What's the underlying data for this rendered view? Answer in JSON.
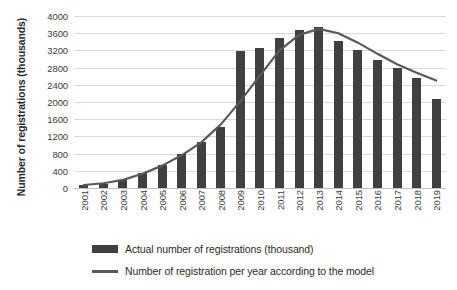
{
  "chart_data": {
    "type": "bar",
    "title": "",
    "subtitle": "",
    "xlabel": "",
    "ylabel": "Number of registrations (thousands)",
    "categories": [
      "2001",
      "2002",
      "2003",
      "2004",
      "2005",
      "2006",
      "2007",
      "2008",
      "2009",
      "2010",
      "2011",
      "2012",
      "2013",
      "2014",
      "2015",
      "2016",
      "2017",
      "2018",
      "2019"
    ],
    "ylim": [
      0,
      4000
    ],
    "y_ticks": [
      0,
      400,
      800,
      1200,
      1600,
      2000,
      2400,
      2800,
      3200,
      3600,
      4000
    ],
    "y_tick_labels": [
      "0",
      "400",
      "800",
      "1200",
      "1600",
      "2000",
      "2400",
      "2800",
      "3200",
      "3600",
      "4000"
    ],
    "grid": true,
    "legend_position": "bottom",
    "series": [
      {
        "name": "Actual number of registrations (thousand)",
        "type": "bar",
        "color": "#404040",
        "values": [
          60,
          100,
          180,
          340,
          530,
          790,
          1080,
          1420,
          3180,
          3260,
          3500,
          3680,
          3740,
          3420,
          3200,
          2980,
          2780,
          2560,
          2080
        ]
      },
      {
        "name": "Number of registration per year according to the model",
        "type": "line",
        "color": "#595959",
        "values": [
          70,
          110,
          190,
          330,
          520,
          760,
          1060,
          1480,
          2020,
          2620,
          3200,
          3560,
          3700,
          3600,
          3380,
          3120,
          2880,
          2680,
          2500
        ]
      }
    ]
  },
  "axes": {
    "y_title": "Number of registrations (thousands)"
  },
  "legend": {
    "items": [
      {
        "label": "Actual number of registrations (thousand)",
        "marker": "bar-swatch",
        "color": "#404040"
      },
      {
        "label": "Number of registration per year according to the model",
        "marker": "line-swatch",
        "color": "#595959"
      }
    ]
  }
}
